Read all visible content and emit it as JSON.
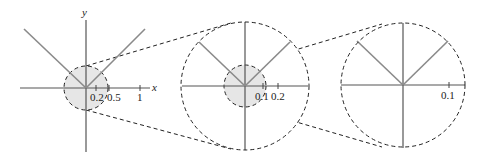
{
  "diagram": {
    "colors": {
      "axis": "#555555",
      "curve": "#8a8a8a",
      "dashed": "#222222",
      "shade": "#e6e6e6"
    },
    "panels": [
      {
        "id": "panel-1",
        "axis_labels": {
          "x": "x",
          "y": "y"
        },
        "ticks": [
          {
            "label": "0.2"
          },
          {
            "label": "0.5"
          },
          {
            "label": "1"
          }
        ]
      },
      {
        "id": "panel-2",
        "ticks": [
          {
            "label": "0.1"
          },
          {
            "label": "0.2"
          }
        ]
      },
      {
        "id": "panel-3",
        "ticks": [
          {
            "label": "0.1"
          }
        ]
      }
    ]
  }
}
